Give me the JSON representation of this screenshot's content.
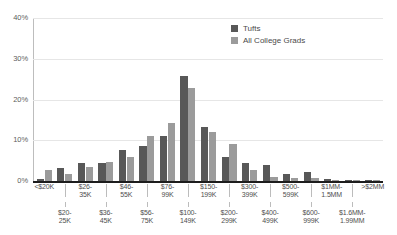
{
  "chart_data": {
    "type": "bar",
    "title": "",
    "subtitle": "",
    "xlabel": "",
    "ylabel": "",
    "ylim": [
      0,
      40
    ],
    "yticks": [
      0,
      10,
      20,
      30,
      40
    ],
    "ytick_labels": [
      "0%",
      "10%",
      "20%",
      "30%",
      "40%"
    ],
    "grid": true,
    "legend_position": "top-right",
    "categories": [
      "<$20K",
      "$20-25K",
      "$26-35K",
      "$36-45K",
      "$46-55K",
      "$56-75K",
      "$76-99K",
      "$100-149K",
      "$150-199K",
      "$200-299K",
      "$300-399K",
      "$400-499K",
      "$500-599K",
      "$600-999K",
      "$1MM-1.5MM",
      "$1.6MM-1.99MM",
      ">$2MM"
    ],
    "series": [
      {
        "name": "Tufts",
        "color": "#585858",
        "values": [
          0.5,
          3.2,
          4.4,
          4.5,
          7.5,
          8.7,
          11.0,
          25.8,
          13.3,
          5.8,
          4.5,
          4.0,
          1.7,
          2.2,
          0.5,
          0.1,
          0.1
        ]
      },
      {
        "name": "All College Grads",
        "color": "#9b9b9b",
        "values": [
          2.8,
          1.7,
          3.4,
          4.7,
          5.9,
          11.0,
          14.3,
          22.8,
          12.1,
          9.2,
          2.6,
          1.0,
          0.7,
          0.7,
          0.3,
          0.1,
          0.2
        ]
      }
    ]
  },
  "legend": {
    "items": [
      {
        "label": "Tufts",
        "swatch_class": "tufts"
      },
      {
        "label": "All College Grads",
        "swatch_class": "grads"
      }
    ]
  },
  "xaxis": {
    "row1": [
      "<$20K",
      "$26-\n35K",
      "$46-\n55K",
      "$76-\n99K",
      "$150-\n199K",
      "$300-\n399K",
      "$500-\n599K",
      "$1MM-\n1.5MM",
      ">$2MM"
    ],
    "row2": [
      "$20-\n25K",
      "$36-\n45K",
      "$56-\n75K",
      "$100-\n149K",
      "$200-\n299K",
      "$400-\n499K",
      "$600-\n999K",
      "$1.6MM-\n1.99MM"
    ],
    "row1_labels": [
      "<$20K",
      "$26-<br>35K",
      "$46-<br>55K",
      "$76-<br>99K",
      "$150-<br>199K",
      "$300-<br>399K",
      "$500-<br>599K",
      "$1MM-<br>1.5MM",
      ">$2MM"
    ],
    "row2_labels": [
      "$20-<br>25K",
      "$36-<br>45K",
      "$56-<br>75K",
      "$100-<br>149K",
      "$200-<br>299K",
      "$400-<br>499K",
      "$600-<br>999K",
      "$1.6MM-<br>1.99MM"
    ]
  },
  "yaxis": {
    "labels": [
      "40%",
      "30%",
      "20%",
      "10%",
      "0%"
    ]
  },
  "colors": {
    "tufts": "#585858",
    "grads": "#9b9b9b",
    "grid": "#e6e6e6",
    "axis": "#1d1d1d",
    "text": "#4f4f4f",
    "background": "#ffffff"
  }
}
